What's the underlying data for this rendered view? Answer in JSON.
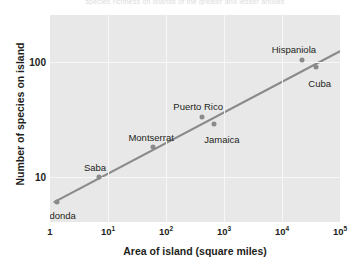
{
  "figure": {
    "cut_off_header": "species richness on islands of the greater and lesser antilles",
    "plot_bg_color": "#e8e8e8",
    "grid_color": "#f7f7f7",
    "point_color": "#8a8a8a",
    "line_color": "#8a8a8a"
  },
  "chart_data": {
    "type": "scatter",
    "title": "",
    "xlabel": "Area of island (square miles)",
    "ylabel": "Number of species on island",
    "xscale": "log",
    "yscale": "log",
    "xlim": [
      1,
      100000
    ],
    "ylim": [
      4,
      260
    ],
    "grid": true,
    "legend": "none",
    "xticks": [
      "1",
      "10",
      "10",
      "10",
      "10",
      "10"
    ],
    "xtick_labels": [
      "1",
      "10¹",
      "10²",
      "10³",
      "10⁴",
      "10⁵"
    ],
    "xtick_bases": [
      "1",
      "10",
      "10",
      "10",
      "10",
      "10"
    ],
    "xtick_exponents": [
      "",
      "1",
      "2",
      "3",
      "4",
      "5"
    ],
    "xtick_values": [
      1,
      10,
      100,
      1000,
      10000,
      100000
    ],
    "yticks": [
      "10",
      "100"
    ],
    "ytick_values": [
      10,
      100
    ],
    "points": [
      {
        "name": "Redonda",
        "x": 1.3,
        "y": 6,
        "label_dx": 0,
        "label_dy": 14,
        "label_align": "left"
      },
      {
        "name": "Saba",
        "x": 7,
        "y": 10,
        "label_dx": -4,
        "label_dy": -9,
        "label_align": "center"
      },
      {
        "name": "Montserrat",
        "x": 60,
        "y": 18,
        "label_dx": -2,
        "label_dy": -9,
        "label_align": "center"
      },
      {
        "name": "Puerto Rico",
        "x": 420,
        "y": 33,
        "label_dx": -4,
        "label_dy": -10,
        "label_align": "center"
      },
      {
        "name": "Jamaica",
        "x": 670,
        "y": 29,
        "label_dx": 8,
        "label_dy": 16,
        "label_align": "center"
      },
      {
        "name": "Hispaniola",
        "x": 22000,
        "y": 105,
        "label_dx": -8,
        "label_dy": -10,
        "label_align": "center"
      },
      {
        "name": "Cuba",
        "x": 38000,
        "y": 92,
        "label_dx": 4,
        "label_dy": 17,
        "label_align": "center"
      }
    ],
    "trendline": {
      "type": "power-law fit",
      "x_start": 1.2,
      "y_start": 6.0,
      "x_end": 100000,
      "y_end": 125
    },
    "annotations": []
  }
}
